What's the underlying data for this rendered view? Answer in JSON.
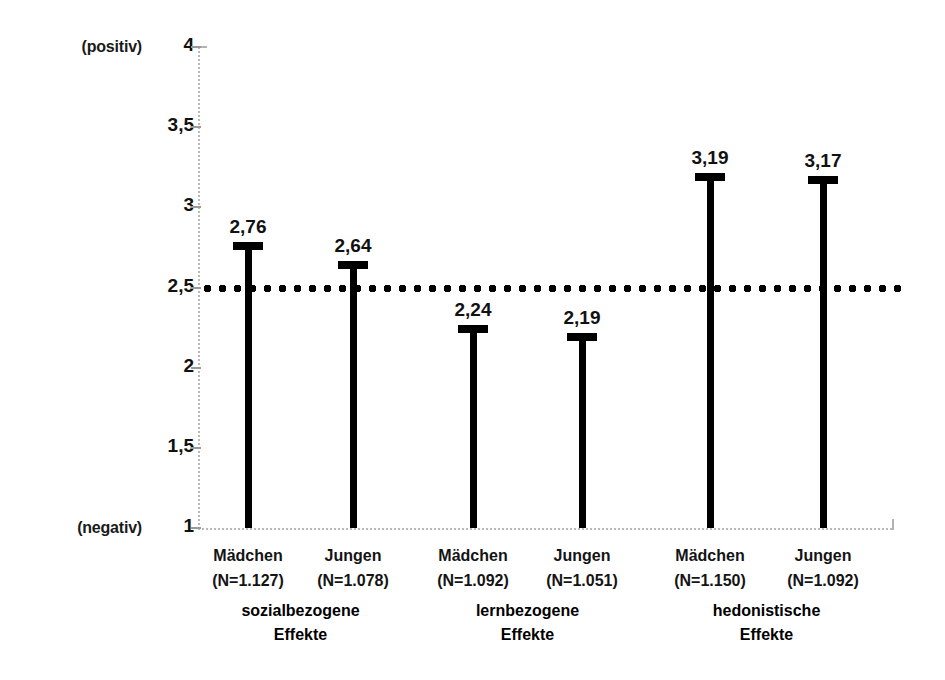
{
  "chart_data": {
    "type": "bar",
    "title": "",
    "subtitle": "",
    "xlabel": "",
    "ylabel": "",
    "ylim": [
      1,
      4
    ],
    "ytick_labels": [
      "4",
      "3,5",
      "3",
      "2,5",
      "2",
      "1,5",
      "1"
    ],
    "ytick_values": [
      4,
      3.5,
      3,
      2.5,
      2,
      1.5,
      1
    ],
    "y_axis_top_annotation": "(positiv)",
    "y_axis_bottom_annotation": "(negativ)",
    "grid": false,
    "legend": null,
    "reference_line": {
      "value": 2.5,
      "style": "dotted",
      "color": "#000000"
    },
    "categories": [
      "Mädchen (N=1.127)",
      "Jungen (N=1.078)",
      "Mädchen (N=1.092)",
      "Jungen (N=1.051)",
      "Mädchen (N=1.150)",
      "Jungen (N=1.092)"
    ],
    "values": [
      2.76,
      2.64,
      2.24,
      2.19,
      3.19,
      3.17
    ],
    "value_labels": [
      "2,76",
      "2,64",
      "2,24",
      "2,19",
      "3,19",
      "3,17"
    ],
    "groups": [
      {
        "line1": "sozialbezogene",
        "line2": "Effekte"
      },
      {
        "line1": "lernbezogene",
        "line2": "Effekte"
      },
      {
        "line1": "hedonistische",
        "line2": "Effekte"
      }
    ]
  },
  "bars": [
    {
      "name": "Mädchen",
      "n_label": "(N=1.127)",
      "value_label": "2,76",
      "value": 2.76
    },
    {
      "name": "Jungen",
      "n_label": "(N=1.078)",
      "value_label": "2,64",
      "value": 2.64
    },
    {
      "name": "Mädchen",
      "n_label": "(N=1.092)",
      "value_label": "2,24",
      "value": 2.24
    },
    {
      "name": "Jungen",
      "n_label": "(N=1.051)",
      "value_label": "2,19",
      "value": 2.19
    },
    {
      "name": "Mädchen",
      "n_label": "(N=1.150)",
      "value_label": "3,19",
      "value": 3.19
    },
    {
      "name": "Jungen",
      "n_label": "(N=1.092)",
      "value_label": "3,17",
      "value": 3.17
    }
  ],
  "axis": {
    "positiv": "(positiv)",
    "negativ": "(negativ)",
    "ticks": [
      "4",
      "3,5",
      "3",
      "2,5",
      "2",
      "1,5",
      "1"
    ]
  },
  "groups": [
    {
      "line1": "sozialbezogene",
      "line2": "Effekte"
    },
    {
      "line1": "lernbezogene",
      "line2": "Effekte"
    },
    {
      "line1": "hedonistische",
      "line2": "Effekte"
    }
  ],
  "colors": {
    "bar": "#000000",
    "reference_line": "#000000",
    "axis": "#b9b9b9",
    "text": "#000000",
    "background": "#ffffff"
  }
}
